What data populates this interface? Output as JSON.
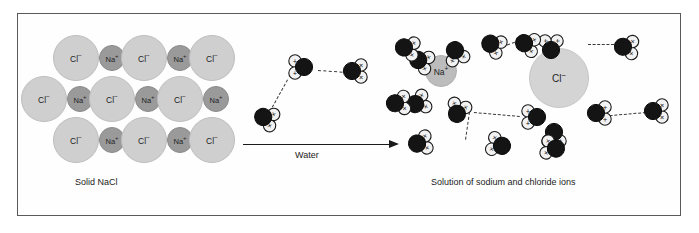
{
  "figure": {
    "title_alt": "Dissolution of solid sodium chloride in water",
    "background": "#ffffff",
    "frame_color": "#5a5a5a"
  },
  "captions": {
    "left": "Solid NaCl",
    "right": "Solution of sodium and chloride ions",
    "arrow": "Water"
  },
  "labels": {
    "chloride": "Cl",
    "chloride_charge": "−",
    "sodium": "Na",
    "sodium_charge": "+",
    "water_negative_mark": "×",
    "water_positive_mark": "+"
  },
  "colors": {
    "chloride_fill": "#cfcfcf",
    "sodium_fill": "#9a9a9a",
    "solution_chloride_fill": "#d4d4d4",
    "solution_sodium_fill": "#bcbcbc",
    "water_oxygen_fill": "#141414",
    "water_hydrogen_fill": "#f2f2f2",
    "bond_color": "#3a3a3a",
    "text_color": "#1b1b1b"
  },
  "chart_data": {
    "type": "diagram",
    "stages": [
      {
        "name": "Solid NaCl",
        "caption": "Solid NaCl",
        "description": "Ionic crystal lattice of alternating sodium and chloride ions",
        "rows": [
          {
            "row": 1,
            "ions": [
              "Cl-",
              "Na+",
              "Cl-",
              "Na+",
              "Cl-"
            ]
          },
          {
            "row": 2,
            "ions": [
              "Cl-",
              "Na+",
              "Cl-",
              "Na+",
              "Cl-",
              "Na+"
            ]
          },
          {
            "row": 3,
            "ions": [
              "Cl-",
              "Na+",
              "Cl-",
              "Na+",
              "Cl-"
            ]
          }
        ],
        "ion_counts": {
          "Cl-": 8,
          "Na+": 8
        }
      },
      {
        "name": "Water",
        "caption": "Water",
        "description": "Polar water molecules with partial negative (x) oxygen and partial positive (+) hydrogen ends, linked by hydrogen bonds",
        "free_water_molecules": 3
      },
      {
        "name": "Solution",
        "caption": "Solution of sodium and chloride ions",
        "description": "Hydrated sodium and chloride ions surrounded by oriented water molecules",
        "hydrated_ions": [
          {
            "ion": "Na+",
            "shell_orientation": "oxygen (x) end toward ion",
            "water_count": 5
          },
          {
            "ion": "Cl-",
            "shell_orientation": "hydrogen (+) end toward ion",
            "water_count": 4
          }
        ],
        "total_water_molecules": 17
      }
    ],
    "legend": [
      {
        "symbol": "x",
        "meaning": "partial negative charge (oxygen end of water)"
      },
      {
        "symbol": "+",
        "meaning": "partial positive charge (hydrogen end of water)"
      },
      {
        "symbol": "dashed line",
        "meaning": "hydrogen bond / ion-dipole attraction"
      }
    ]
  },
  "lattice": {
    "ions": [
      {
        "id": "l1",
        "type": "Cl",
        "x": 53,
        "y": 35,
        "r": 23
      },
      {
        "id": "l2",
        "type": "Na",
        "x": 99,
        "y": 45,
        "r": 13
      },
      {
        "id": "l3",
        "type": "Cl",
        "x": 121,
        "y": 35,
        "r": 23
      },
      {
        "id": "l4",
        "type": "Na",
        "x": 167,
        "y": 45,
        "r": 13
      },
      {
        "id": "l5",
        "type": "Cl",
        "x": 189,
        "y": 35,
        "r": 23
      },
      {
        "id": "m1",
        "type": "Cl",
        "x": 21,
        "y": 76,
        "r": 23
      },
      {
        "id": "m2",
        "type": "Na",
        "x": 67,
        "y": 86,
        "r": 13
      },
      {
        "id": "m3",
        "type": "Cl",
        "x": 89,
        "y": 76,
        "r": 23
      },
      {
        "id": "m4",
        "type": "Na",
        "x": 135,
        "y": 86,
        "r": 13
      },
      {
        "id": "m5",
        "type": "Cl",
        "x": 157,
        "y": 76,
        "r": 23
      },
      {
        "id": "m6",
        "type": "Na",
        "x": 203,
        "y": 86,
        "r": 13
      },
      {
        "id": "b1",
        "type": "Cl",
        "x": 53,
        "y": 117,
        "r": 23
      },
      {
        "id": "b2",
        "type": "Na",
        "x": 99,
        "y": 127,
        "r": 13
      },
      {
        "id": "b3",
        "type": "Cl",
        "x": 121,
        "y": 117,
        "r": 23
      },
      {
        "id": "b4",
        "type": "Na",
        "x": 167,
        "y": 127,
        "r": 13
      },
      {
        "id": "b5",
        "type": "Cl",
        "x": 189,
        "y": 117,
        "r": 23
      }
    ]
  },
  "solution": {
    "na_ion": {
      "x": 441,
      "y": 71,
      "r": 16
    },
    "cl_ion": {
      "x": 559,
      "y": 78,
      "r": 30
    }
  }
}
